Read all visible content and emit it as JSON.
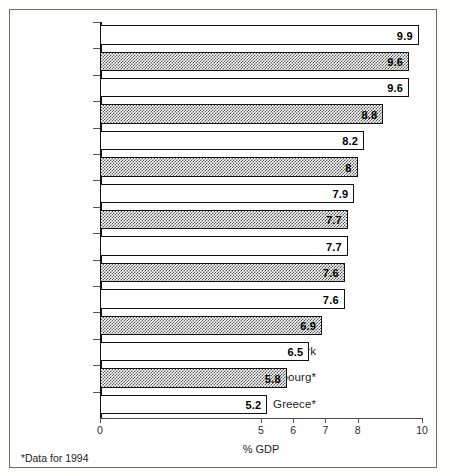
{
  "chart_data": {
    "type": "bar",
    "orientation": "horizontal",
    "title": "",
    "xlabel": "% GDP",
    "ylabel": "",
    "xlim": [
      0,
      10
    ],
    "grid": false,
    "legend": null,
    "xticks": [
      "0",
      "5",
      "6",
      "7",
      "8",
      "10"
    ],
    "xtick_values": [
      0,
      5,
      6,
      7,
      8,
      10
    ],
    "categories": [
      "France",
      "Austria",
      "Germany",
      "Netherlands",
      "Finland",
      "Belgium",
      "Ireland*",
      "Sweden",
      "Italy",
      "Portugal*",
      "Spain",
      "UK",
      "Denmark",
      "Luxembourg*",
      "Greece*"
    ],
    "values": [
      9.9,
      9.6,
      9.6,
      8.8,
      8.2,
      8,
      7.9,
      7.7,
      7.7,
      7.6,
      7.6,
      6.9,
      6.5,
      5.8,
      5.2
    ],
    "value_labels": [
      "9.9",
      "9.6",
      "9.6",
      "8.8",
      "8.2",
      "8",
      "7.9",
      "7.7",
      "7.7",
      "7.6",
      "7.6",
      "6.9",
      "6.5",
      "5.8",
      "5.2"
    ],
    "bar_styles": [
      "plain",
      "hatched",
      "plain",
      "hatched",
      "plain",
      "hatched",
      "plain",
      "hatched",
      "plain",
      "hatched",
      "plain",
      "hatched",
      "plain",
      "hatched",
      "plain"
    ],
    "colors": {
      "bar_plain_fill": "#ffffff",
      "bar_hatched_fill": "#8a8a8a",
      "bar_outline": "#111111",
      "axis": "#4a4a4a",
      "text": "#1d1d1d",
      "frame": "#6d6d6d"
    }
  },
  "footnote": {
    "marker": "*",
    "text": "Data for 1994"
  }
}
